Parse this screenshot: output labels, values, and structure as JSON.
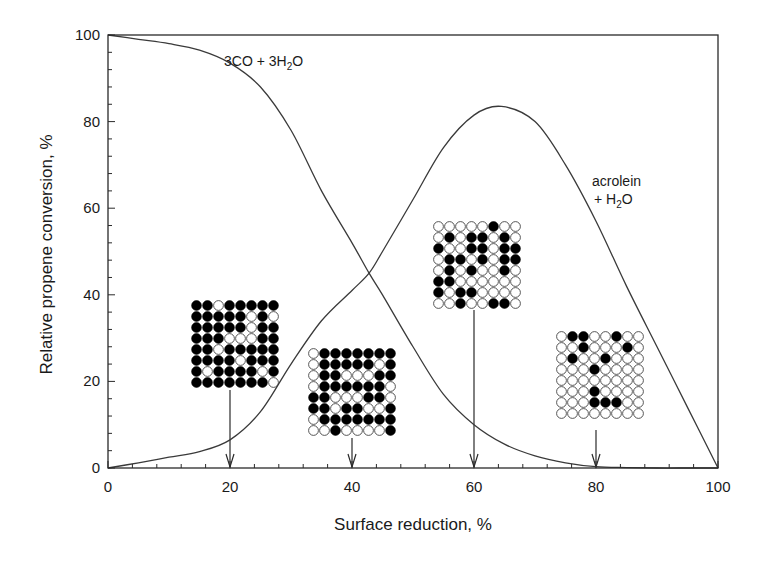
{
  "chart_data": {
    "type": "line",
    "title": "",
    "xlabel": "Surface reduction, %",
    "ylabel": "Relative propene conversion, %",
    "xlim": [
      0,
      100
    ],
    "ylim": [
      0,
      100
    ],
    "xticks": [
      0,
      20,
      40,
      60,
      80,
      100
    ],
    "yticks": [
      0,
      20,
      40,
      60,
      80,
      100
    ],
    "minor_tick_step": 4,
    "grid": false,
    "legend": "none (inline curve labels)",
    "series": [
      {
        "name": "3CO + 3H2O",
        "label_main": "3CO + 3H",
        "label_sub": "2",
        "label_tail": "O",
        "x": [
          0,
          5,
          10,
          15,
          20,
          25,
          30,
          35,
          40,
          42.8,
          45,
          50,
          55,
          60,
          65,
          70,
          75,
          80,
          85,
          90,
          95,
          100
        ],
        "values": [
          100,
          99,
          98,
          96.5,
          93.5,
          88,
          78,
          64,
          52,
          45,
          40,
          28,
          17,
          10,
          5.5,
          2.8,
          1.2,
          0.3,
          0.1,
          0,
          0,
          0
        ]
      },
      {
        "name": "acrolein + H2O",
        "label_line1": "acrolein",
        "label_line2_main": "+ H",
        "label_line2_sub": "2",
        "label_line2_tail": "O",
        "x": [
          0,
          5,
          10,
          15,
          20,
          25,
          30,
          35,
          40,
          42.8,
          45,
          50,
          55,
          60,
          64.5,
          70,
          75,
          80,
          85,
          90,
          95,
          100
        ],
        "values": [
          0,
          1.2,
          2.5,
          3.8,
          6.5,
          13,
          24,
          34,
          41,
          45,
          50,
          62,
          74,
          81.5,
          83.5,
          80,
          70,
          57,
          42,
          28,
          14,
          0
        ]
      }
    ],
    "annotations": [
      {
        "type": "arrow",
        "x": 20,
        "lattice": [
          [
            1,
            1,
            0,
            1,
            1,
            1,
            1,
            1
          ],
          [
            1,
            1,
            1,
            1,
            1,
            0,
            1,
            0
          ],
          [
            1,
            1,
            1,
            1,
            1,
            0,
            1,
            1
          ],
          [
            1,
            1,
            1,
            0,
            0,
            0,
            1,
            1
          ],
          [
            1,
            1,
            0,
            1,
            1,
            1,
            1,
            1
          ],
          [
            1,
            1,
            1,
            1,
            0,
            1,
            1,
            1
          ],
          [
            1,
            0,
            1,
            1,
            1,
            1,
            0,
            1
          ],
          [
            1,
            1,
            1,
            1,
            1,
            1,
            1,
            0
          ]
        ]
      },
      {
        "type": "arrow",
        "x": 40,
        "lattice": [
          [
            0,
            1,
            1,
            1,
            1,
            1,
            1,
            1
          ],
          [
            0,
            1,
            1,
            1,
            1,
            1,
            0,
            1
          ],
          [
            0,
            1,
            1,
            0,
            0,
            0,
            1,
            1
          ],
          [
            0,
            1,
            1,
            1,
            1,
            1,
            1,
            0
          ],
          [
            1,
            1,
            0,
            0,
            0,
            1,
            1,
            0
          ],
          [
            1,
            1,
            0,
            1,
            1,
            0,
            0,
            1
          ],
          [
            0,
            1,
            1,
            1,
            1,
            1,
            1,
            1
          ],
          [
            0,
            0,
            1,
            0,
            0,
            0,
            0,
            1
          ]
        ]
      },
      {
        "type": "arrow",
        "x": 60,
        "lattice": [
          [
            0,
            0,
            0,
            0,
            0,
            1,
            0,
            0
          ],
          [
            0,
            1,
            0,
            1,
            1,
            0,
            1,
            0
          ],
          [
            1,
            0,
            0,
            1,
            1,
            0,
            1,
            1
          ],
          [
            0,
            1,
            1,
            0,
            1,
            0,
            1,
            1
          ],
          [
            0,
            1,
            0,
            1,
            0,
            0,
            1,
            0
          ],
          [
            1,
            1,
            0,
            0,
            0,
            0,
            0,
            0
          ],
          [
            1,
            0,
            1,
            1,
            0,
            0,
            0,
            0
          ],
          [
            0,
            0,
            1,
            0,
            0,
            1,
            1,
            0
          ]
        ]
      },
      {
        "type": "arrow",
        "x": 80,
        "lattice": [
          [
            0,
            1,
            1,
            0,
            0,
            1,
            0,
            0
          ],
          [
            0,
            0,
            1,
            0,
            0,
            0,
            1,
            0
          ],
          [
            0,
            1,
            0,
            0,
            1,
            0,
            0,
            0
          ],
          [
            0,
            0,
            0,
            1,
            0,
            0,
            0,
            0
          ],
          [
            0,
            0,
            0,
            0,
            0,
            0,
            0,
            0
          ],
          [
            0,
            0,
            0,
            1,
            0,
            0,
            0,
            0
          ],
          [
            0,
            0,
            0,
            1,
            1,
            1,
            0,
            0
          ],
          [
            0,
            0,
            0,
            0,
            0,
            0,
            0,
            0
          ]
        ]
      }
    ]
  },
  "layout": {
    "plot": {
      "left": 108,
      "right": 718,
      "top": 35,
      "bottom": 468
    },
    "lattice_positions": [
      {
        "left": 191,
        "top": 300
      },
      {
        "left": 308,
        "top": 348
      },
      {
        "left": 433,
        "top": 221
      },
      {
        "left": 556,
        "top": 331
      }
    ],
    "arrow_tops": [
      390,
      438,
      310,
      430
    ],
    "lattice_cell": 11,
    "colors": {
      "line": "#3a3a3a",
      "axis": "#2a2a2a",
      "atom_filled": "#000000",
      "atom_empty": "#ffffff"
    }
  }
}
